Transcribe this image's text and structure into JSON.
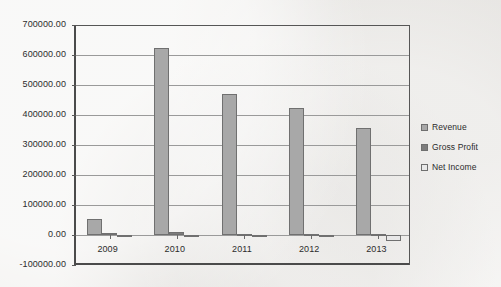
{
  "chart_data": {
    "type": "bar",
    "title": "",
    "subtitle": "",
    "xlabel": "",
    "ylabel": "",
    "categories": [
      "2009",
      "2010",
      "2011",
      "2012",
      "2013"
    ],
    "series": [
      {
        "name": "Revenue",
        "color": "#a8a8a8",
        "values": [
          55000.0,
          625000.0,
          470000.0,
          423000.0,
          357000.0
        ]
      },
      {
        "name": "Gross Profit",
        "color": "#7d7d7d",
        "values": [
          8000.0,
          9000.0,
          4000.0,
          3000.0,
          2000.0
        ]
      },
      {
        "name": "Net Income",
        "color": "#e8e8e8",
        "values": [
          1000.0,
          1000.0,
          -2000.0,
          -1000.0,
          -21000.0
        ]
      }
    ],
    "ylim": [
      -100000,
      700000
    ],
    "ytick_labels": [
      "700000.00",
      "600000.00",
      "500000.00",
      "400000.00",
      "300000.00",
      "200000.00",
      "100000.00",
      "0.00",
      "-100000.00"
    ],
    "ytick_values": [
      700000,
      600000,
      500000,
      400000,
      300000,
      200000,
      100000,
      0,
      -100000
    ],
    "grid": true,
    "legend_position": "right",
    "plot_border_color": "#4b4b4b",
    "gridline_color": "#9a9a9a",
    "background_color": "#f2f1ef"
  },
  "legend": {
    "entries": [
      {
        "label": "Revenue",
        "swatch": "legend-swatch-revenue"
      },
      {
        "label": "Gross Profit",
        "swatch": "legend-swatch-gross-profit"
      },
      {
        "label": "Net Income",
        "swatch": "legend-swatch-net-income"
      }
    ]
  }
}
